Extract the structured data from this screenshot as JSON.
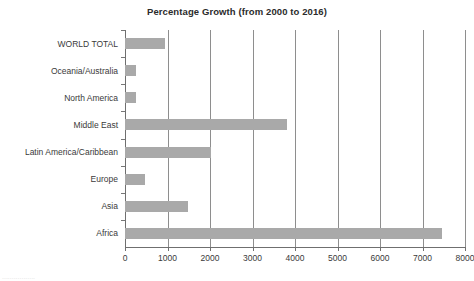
{
  "chart_data": {
    "type": "bar",
    "orientation": "horizontal",
    "title": "Percentage Growth (from 2000 to 2016)",
    "xlabel": "",
    "ylabel": "",
    "xlim": [
      0,
      8000
    ],
    "ylim": null,
    "grid": true,
    "legend": null,
    "bar_color": "#a9a9a9",
    "xticks": [
      0,
      1000,
      2000,
      3000,
      4000,
      5000,
      6000,
      7000,
      8000
    ],
    "xtick_labels": [
      "0",
      "1000",
      "2000",
      "3000",
      "4000",
      "5000",
      "6000",
      "7000",
      "8000"
    ],
    "categories": [
      "WORLD TOTAL",
      "Oceania/Australia",
      "North America",
      "Middle East",
      "Latin America/Caribbean",
      "Europe",
      "Asia",
      "Africa"
    ],
    "values": [
      935,
      270,
      265,
      3800,
      2030,
      480,
      1480,
      7470
    ]
  },
  "footer": {
    "artifact_text": "................."
  }
}
